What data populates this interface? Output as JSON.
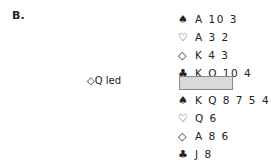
{
  "problem_label": "B.",
  "lead_text": "◇Q led",
  "north": [
    {
      "suit": "♠",
      "cards": "A 10 3"
    },
    {
      "suit": "♡",
      "cards": "A 3 2"
    },
    {
      "suit": "◇",
      "cards": "K 4 3"
    },
    {
      "suit": "♣",
      "cards": "K Q 10 4"
    }
  ],
  "south": [
    {
      "suit": "♠",
      "cards": "K Q 8 7 5 4"
    },
    {
      "suit": "♡",
      "cards": "Q 6"
    },
    {
      "suit": "◇",
      "cards": "A 8 6"
    },
    {
      "suit": "♣",
      "cards": "J 8"
    }
  ]
}
